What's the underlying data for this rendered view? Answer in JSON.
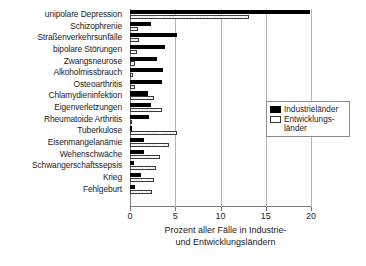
{
  "chart_data": {
    "type": "bar",
    "orientation": "horizontal",
    "title": "",
    "xlabel": "Prozent aller Fälle in Industrie- und Entwicklungsländern",
    "xlabel_line1": "Prozent aller Fälle in Industrie-",
    "xlabel_line2": "und Entwicklungsländern",
    "ylabel": "",
    "xlim": [
      0,
      20
    ],
    "xticks": [
      0,
      5,
      10,
      15,
      20
    ],
    "xticklabels": [
      "0",
      "5",
      "10",
      "15",
      "20"
    ],
    "grid": true,
    "legend_position": "middle-right",
    "categories": [
      "unipolare Depression",
      "Schizophrenie",
      "Straßenverkehrsunfälle",
      "bipolare Störungen",
      "Zwangsneurose",
      "Alkoholmissbrauch",
      "Osteoarthritis",
      "Chlamydieninfektion",
      "Eigenverletzungen",
      "Rheumatoide Arthritis",
      "Tuberkulose",
      "Eisenmangelanämie",
      "Wehenschwäche",
      "Schwangerschaftssepsis",
      "Krieg",
      "Fehlgeburt"
    ],
    "series": [
      {
        "name": "Industrieländer",
        "color": "#000000",
        "values": [
          19.9,
          2.3,
          5.2,
          3.9,
          3.0,
          3.6,
          3.5,
          2.0,
          2.3,
          2.1,
          0.2,
          1.6,
          1.5,
          0.4,
          1.2,
          0.5
        ]
      },
      {
        "name": "Entwicklungsländer",
        "color": "#ffffff",
        "values": [
          13.2,
          0.9,
          1.0,
          0.8,
          0.6,
          0.3,
          0.5,
          2.6,
          3.5,
          0.2,
          5.2,
          4.3,
          3.3,
          2.9,
          2.7,
          2.4
        ]
      }
    ]
  },
  "legend": {
    "items": [
      {
        "label": "Industrieländer"
      },
      {
        "label": "Entwicklungs-\nländer"
      }
    ]
  }
}
